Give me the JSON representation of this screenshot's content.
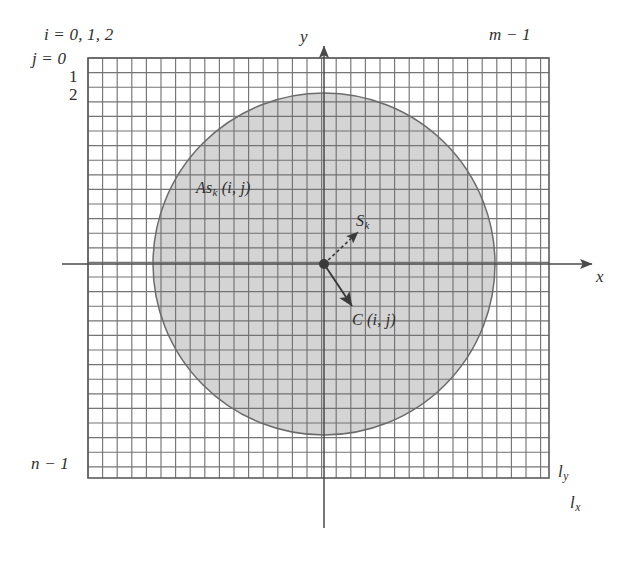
{
  "figure": {
    "background_color": "#ffffff"
  },
  "grid": {
    "x_left": 88,
    "x_right": 549,
    "y_top": 58,
    "y_bottom": 478,
    "cell_size": 14.6,
    "columns": 32,
    "rows": 29,
    "line_color": "#6e6e6e",
    "fill_color": "#ffffff"
  },
  "axes": {
    "x": {
      "label": "x",
      "start_x": 62,
      "end_x": 592,
      "y": 264,
      "color": "#4a4a4a"
    },
    "y": {
      "label": "y",
      "x": 324,
      "start_y": 528,
      "end_y": 46,
      "color": "#4a4a4a"
    }
  },
  "circle": {
    "center_x": 324,
    "center_y": 264,
    "radius": 171,
    "fill_color": "#b9b9b9",
    "fill_opacity": 0.62,
    "stroke_color": "#6b6b6b"
  },
  "center_point": {
    "x": 324,
    "y": 264,
    "radius": 5,
    "color": "#3a3a3a"
  },
  "vectors": [
    {
      "name": "S_k",
      "from_x": 324,
      "from_y": 264,
      "to_x": 358,
      "to_y": 232,
      "style": "dashed",
      "color": "#3a3a3a"
    },
    {
      "name": "C_ij",
      "from_x": 324,
      "from_y": 264,
      "to_x": 352,
      "to_y": 306,
      "style": "solid",
      "color": "#3a3a3a"
    }
  ],
  "labels": {
    "i_indices": "i = 0, 1, 2",
    "j_index_label": "j = 0",
    "j_index_1": "1",
    "j_index_2": "2",
    "m_minus_1": "m − 1",
    "n_minus_1": "n − 1",
    "l_y_base": "l",
    "l_y_sub": "y",
    "l_x_base": "l",
    "l_x_sub": "x",
    "axis_y": "y",
    "axis_x": "x",
    "as_k_base": "As",
    "as_k_sub": "k",
    "as_k_args": " (i, j)",
    "s_k_base": "S",
    "s_k_sub": "k",
    "c_ij": "C (i, j)"
  }
}
